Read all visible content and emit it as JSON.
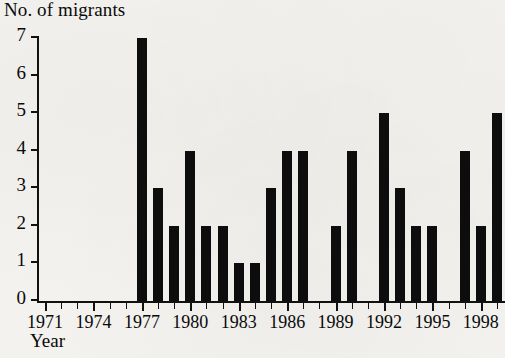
{
  "chart_data": {
    "type": "bar",
    "title": "",
    "ylabel": "No. of migrants",
    "xlabel": "Year",
    "ylim": [
      0,
      7
    ],
    "ytick_labels": [
      "0",
      "1",
      "2",
      "3",
      "4",
      "5",
      "6",
      "7"
    ],
    "ytick_values": [
      0,
      1,
      2,
      3,
      4,
      5,
      6,
      7
    ],
    "xtick_labels": [
      "1971",
      "1974",
      "1977",
      "1980",
      "1983",
      "1986",
      "1989",
      "1992",
      "1995",
      "1998"
    ],
    "xtick_values": [
      1971,
      1974,
      1977,
      1980,
      1983,
      1986,
      1989,
      1992,
      1995,
      1998
    ],
    "xlim": [
      1971,
      2000
    ],
    "grid": false,
    "legend": null,
    "bar_color": "#0d0d0d",
    "categories": [
      "1971",
      "1972",
      "1973",
      "1974",
      "1975",
      "1976",
      "1977",
      "1978",
      "1979",
      "1980",
      "1981",
      "1982",
      "1983",
      "1984",
      "1985",
      "1986",
      "1987",
      "1988",
      "1989",
      "1990",
      "1991",
      "1992",
      "1993",
      "1994",
      "1995",
      "1996",
      "1997",
      "1998",
      "1999"
    ],
    "values": [
      0,
      0,
      0,
      0,
      0,
      0,
      7,
      3,
      2,
      4,
      2,
      2,
      1,
      1,
      3,
      4,
      4,
      0,
      2,
      4,
      0,
      5,
      3,
      2,
      2,
      0,
      4,
      2,
      5
    ]
  }
}
